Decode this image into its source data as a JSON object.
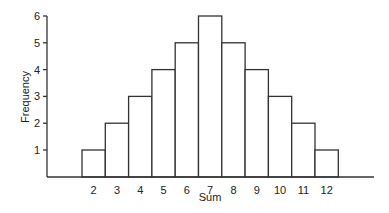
{
  "chart_data": {
    "type": "bar",
    "title": "",
    "xlabel": "Sum",
    "ylabel": "Frequency",
    "categories": [
      "2",
      "3",
      "4",
      "5",
      "6",
      "7",
      "8",
      "9",
      "10",
      "11",
      "12"
    ],
    "values": [
      1,
      2,
      3,
      4,
      5,
      6,
      5,
      4,
      3,
      2,
      1
    ],
    "yticks": [
      "1",
      "2",
      "3",
      "4",
      "5",
      "6"
    ],
    "ylim": [
      0,
      6
    ],
    "grid": false,
    "legend": "none",
    "bar_fill": "#ffffff",
    "bar_stroke": "#333333"
  }
}
